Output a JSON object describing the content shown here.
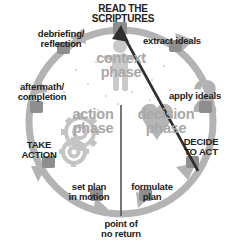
{
  "diagram": {
    "ring_color": "#b3b3b3",
    "phase_label_color": "#a8a8a8",
    "text_color": "#222222",
    "arrow_color": "#333333",
    "background": "#ffffff"
  },
  "nodes": {
    "read_scriptures": "READ THE\nSCRIPTURES",
    "extract_ideals": "extract ideals",
    "apply_ideals": "apply ideals",
    "decide_to_act": "DECIDE\nTO ACT",
    "formulate_plan": "formulate\nplan",
    "set_plan_in_motion": "set plan\nin motion",
    "take_action": "TAKE\nACTION",
    "aftermath_completion": "aftermath/\ncompletion",
    "debriefing_reflection": "debriefing/\nreflection"
  },
  "phases": {
    "context": "context\nphase",
    "decision": "decision\nphase",
    "action": "action\nphase"
  },
  "annotations": {
    "point_of_no_return": "point of\nno return",
    "step_number_2": "2"
  },
  "icons": {
    "person": "person-icon",
    "heart": "heart-icon",
    "gear": "gear-icon",
    "arrowhead": "arrowhead-icon",
    "divider": "vertical-divider"
  }
}
